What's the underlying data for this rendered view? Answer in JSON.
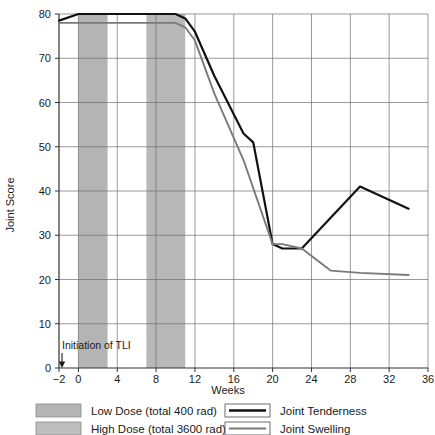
{
  "chart_data": {
    "type": "line",
    "title": "",
    "xlabel": "Weeks",
    "ylabel": "Joint Score",
    "xlim": [
      -2,
      36
    ],
    "ylim": [
      0,
      80
    ],
    "xticks": [
      "−2",
      "0",
      "4",
      "8",
      "12",
      "16",
      "20",
      "24",
      "28",
      "32",
      "36"
    ],
    "xtick_values": [
      -2,
      0,
      4,
      8,
      12,
      16,
      20,
      24,
      28,
      32,
      36
    ],
    "yticks": [
      "0",
      "10",
      "20",
      "30",
      "40",
      "50",
      "60",
      "70",
      "80"
    ],
    "ytick_values": [
      0,
      10,
      20,
      30,
      40,
      50,
      60,
      70,
      80
    ],
    "grid": true,
    "legend_position": "below-plot",
    "series": [
      {
        "name": "Joint Tenderness",
        "color": "#111111",
        "x": [
          -2,
          0,
          2,
          6,
          10,
          11,
          12,
          14,
          17,
          18,
          20,
          21,
          23,
          29,
          34
        ],
        "values": [
          78.5,
          80,
          80,
          80,
          80,
          79,
          76,
          66,
          53,
          51,
          28,
          27,
          27,
          41,
          36
        ]
      },
      {
        "name": "Joint Swelling",
        "color": "#7a7a7a",
        "x": [
          -2,
          0,
          2,
          6,
          10,
          11,
          12,
          14,
          17,
          20,
          21,
          23,
          26,
          29,
          34
        ],
        "values": [
          78,
          78,
          78,
          78,
          78,
          77,
          74,
          62,
          47,
          28,
          28,
          27,
          22,
          21.5,
          21
        ]
      }
    ],
    "bands": [
      {
        "name": "Low Dose (total 400 rad)",
        "x0": 0,
        "x1": 3,
        "color": "#b4b4b4"
      },
      {
        "name": "High Dose (total 3600 rad)",
        "x0": 7,
        "x1": 11,
        "color": "#b8b8b8"
      }
    ],
    "annotations": [
      {
        "text": "Initiation of TLI",
        "x": 0,
        "y": 5,
        "arrow": "down"
      }
    ]
  },
  "legend": {
    "bands": [
      {
        "label": "Low Dose (total 400 rad)",
        "swatch_color": "#b4b4b4"
      },
      {
        "label": "High Dose (total 3600 rad)",
        "swatch_color": "#bdbdbd"
      }
    ],
    "lines": [
      {
        "label": "Joint Tenderness",
        "color": "#111111"
      },
      {
        "label": "Joint Swelling",
        "color": "#7a7a7a"
      }
    ]
  }
}
